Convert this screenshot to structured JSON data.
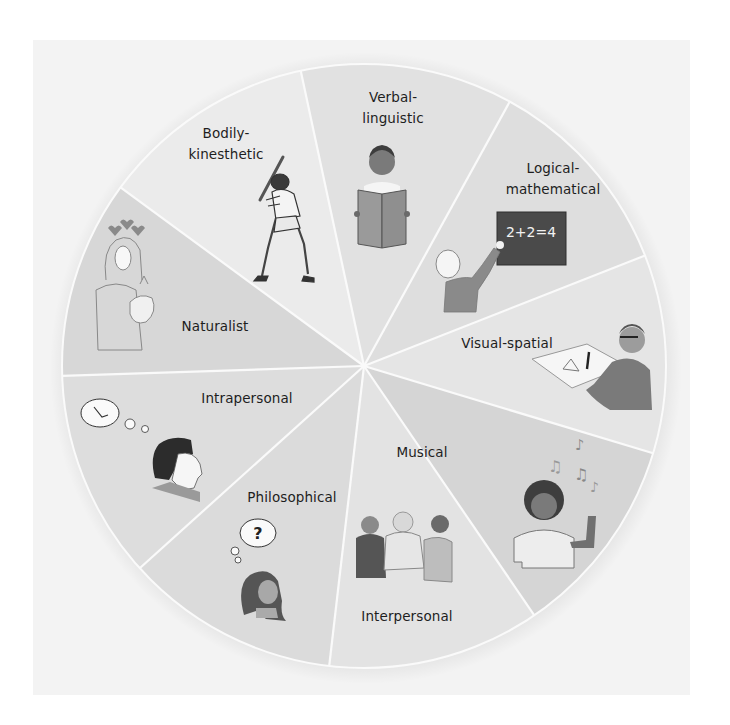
{
  "diagram": {
    "type": "segmented-wheel",
    "center": [
      364,
      366
    ],
    "radius": 302,
    "colors": {
      "background": "#ffffff",
      "panel": "#f3f3f3",
      "divider": "#fafafa",
      "text": "#1e1e1e"
    },
    "segments": [
      {
        "id": "bodily-kinesthetic",
        "line1": "Bodily-",
        "line2": "kinesthetic",
        "fill": "#ebebeb",
        "edge_start": [
          120,
          187
        ],
        "edge_end": [
          301,
          72
        ],
        "label_pos": [
          226,
          144
        ],
        "icon": "baseball-batter-icon"
      },
      {
        "id": "verbal-linguistic",
        "line1": "Verbal-",
        "line2": "linguistic",
        "fill": "#e1e1e1",
        "edge_start": [
          301,
          72
        ],
        "edge_end": [
          509,
          103
        ],
        "label_pos": [
          393,
          108
        ],
        "icon": "reading-child-icon"
      },
      {
        "id": "logical-mathematical",
        "line1": "Logical-",
        "line2": "mathematical",
        "fill": "#dedede",
        "edge_start": [
          509,
          103
        ],
        "edge_end": [
          654,
          252
        ],
        "label_pos": [
          553,
          179
        ],
        "icon": "chalkboard-math-icon"
      },
      {
        "id": "visual-spatial",
        "line1": "Visual-spatial",
        "line2": "",
        "fill": "#e5e5e5",
        "edge_start": [
          654,
          252
        ],
        "edge_end": [
          662,
          456
        ],
        "label_pos": [
          507,
          343
        ],
        "icon": "drafting-person-icon"
      },
      {
        "id": "musical",
        "line1": "Musical",
        "line2": "",
        "fill": "#d5d5d5",
        "edge_start": [
          662,
          456
        ],
        "edge_end": [
          532,
          612
        ],
        "label_pos": [
          422,
          452
        ],
        "icon": "music-listener-icon"
      },
      {
        "id": "interpersonal",
        "line1": "Interpersonal",
        "line2": "",
        "fill": "#e3e3e3",
        "edge_start": [
          532,
          612
        ],
        "edge_end": [
          329,
          668
        ],
        "label_pos": [
          407,
          616
        ],
        "icon": "group-talking-icon"
      },
      {
        "id": "philosophical",
        "line1": "Philosophical",
        "line2": "",
        "fill": "#dbdbdb",
        "edge_start": [
          329,
          668
        ],
        "edge_end": [
          140,
          568
        ],
        "label_pos": [
          292,
          497
        ],
        "icon": "question-thought-icon"
      },
      {
        "id": "intrapersonal",
        "line1": "Intrapersonal",
        "line2": "",
        "fill": "#dddddd",
        "edge_start": [
          140,
          568
        ],
        "edge_end": [
          60,
          376
        ],
        "label_pos": [
          247,
          398
        ],
        "icon": "reflecting-person-icon"
      },
      {
        "id": "naturalist",
        "line1": "Naturalist",
        "line2": "",
        "fill": "#d7d7d7",
        "edge_start": [
          60,
          376
        ],
        "edge_end": [
          120,
          187
        ],
        "label_pos": [
          215,
          326
        ],
        "icon": "woman-holding-rabbit-icon"
      }
    ],
    "chalkboard_text": "2+2=4",
    "thought_symbol": "?"
  }
}
